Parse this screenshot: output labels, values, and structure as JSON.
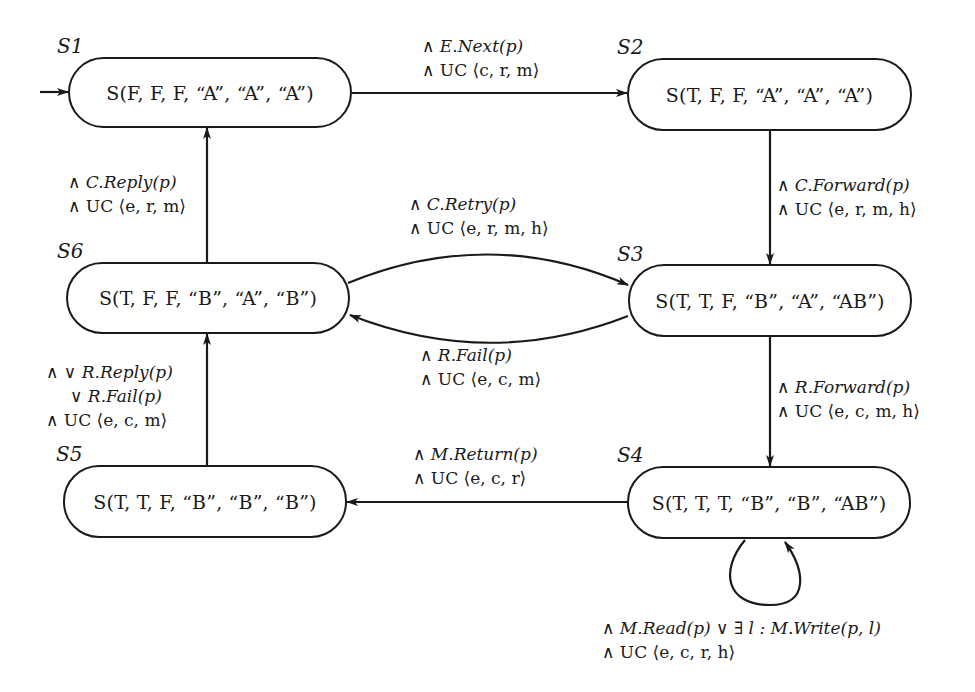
{
  "diagram": {
    "type": "state-transition",
    "states": [
      {
        "id": "S1",
        "label": "S(F, F, F, “A”, “A”, “A”)",
        "initial": true
      },
      {
        "id": "S2",
        "label": "S(T, F, F, “A”, “A”, “A”)"
      },
      {
        "id": "S3",
        "label": "S(T, T, F, “B”, “A”, “AB”)"
      },
      {
        "id": "S4",
        "label": "S(T, T, T, “B”, “B”, “AB”)"
      },
      {
        "id": "S5",
        "label": "S(T, T, F, “B”, “B”, “B”)"
      },
      {
        "id": "S6",
        "label": "S(T, F, F, “B”, “A”, “B”)"
      }
    ],
    "transitions": [
      {
        "from": "S1",
        "to": "S2",
        "lines": [
          "∧ E.Next(p)",
          "∧ UC ⟨c, r, m⟩"
        ]
      },
      {
        "from": "S2",
        "to": "S3",
        "lines": [
          "∧ C.Forward(p)",
          "∧ UC ⟨e, r, m, h⟩"
        ]
      },
      {
        "from": "S6",
        "to": "S3",
        "lines": [
          "∧ C.Retry(p)",
          "∧ UC ⟨e, r, m, h⟩"
        ]
      },
      {
        "from": "S3",
        "to": "S6",
        "lines": [
          "∧ R.Fail(p)",
          "∧ UC ⟨e, c, m⟩"
        ]
      },
      {
        "from": "S3",
        "to": "S4",
        "lines": [
          "∧ R.Forward(p)",
          "∧ UC ⟨e, c, m, h⟩"
        ]
      },
      {
        "from": "S4",
        "to": "S5",
        "lines": [
          "∧ M.Return(p)",
          "∧ UC ⟨e, c, r⟩"
        ]
      },
      {
        "from": "S4",
        "to": "S4",
        "lines": [
          "∧ M.Read(p) ∨ ∃ l : M.Write(p, l)",
          "∧ UC ⟨e, c, r, h⟩"
        ]
      },
      {
        "from": "S5",
        "to": "S6",
        "lines": [
          "∧ ∨ R.Reply(p)",
          "∨ R.Fail(p)",
          "∧ UC ⟨e, c, m⟩"
        ]
      },
      {
        "from": "S6",
        "to": "S1",
        "lines": [
          "∧ C.Reply(p)",
          "∧ UC ⟨e, r, m⟩"
        ]
      }
    ]
  }
}
